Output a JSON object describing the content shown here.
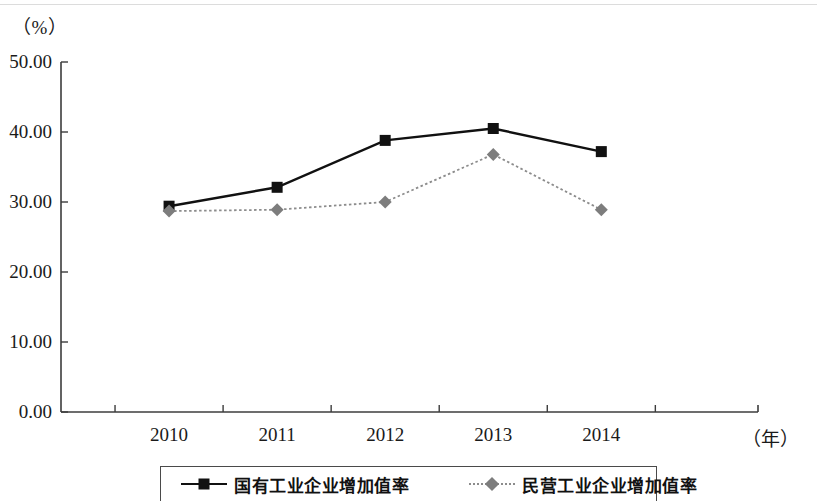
{
  "chart_data": {
    "type": "line",
    "title": "",
    "subtitle": "",
    "xlabel": "（年）",
    "ylabel": "（%）",
    "categories": [
      "2010",
      "2011",
      "2012",
      "2013",
      "2014"
    ],
    "ylim": [
      0,
      50
    ],
    "ytick_labels": [
      "0.00",
      "10.00",
      "20.00",
      "30.00",
      "40.00",
      "50.00"
    ],
    "ytick_values": [
      0,
      10,
      20,
      30,
      40,
      50
    ],
    "grid": false,
    "legend_position": "bottom",
    "series": [
      {
        "name": "国有工业企业增加值率",
        "values": [
          29.4,
          32.1,
          38.8,
          40.5,
          37.2
        ],
        "color": "#111111",
        "marker": "square",
        "line_style": "solid"
      },
      {
        "name": "民营工业企业增加值率",
        "values": [
          28.7,
          28.9,
          30.0,
          36.8,
          28.9
        ],
        "color": "#8c8c8c",
        "marker": "diamond",
        "line_style": "dotted"
      }
    ]
  },
  "axes": {
    "y_unit": "（%）",
    "x_unit": "（年）",
    "axis_color": "#3c3c3c"
  },
  "legend": {
    "items": [
      {
        "label": "国有工业企业增加值率",
        "marker": "square-marker-icon"
      },
      {
        "label": "民营工业企业增加值率",
        "marker": "diamond-marker-icon"
      }
    ]
  }
}
